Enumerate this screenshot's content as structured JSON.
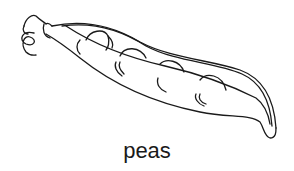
{
  "illustration": {
    "subject": "pea pod",
    "style": "black line art on white",
    "stroke_color": "#1a1a1a",
    "background": "#ffffff",
    "pea_count_visible": 4
  },
  "caption": {
    "text": "peas"
  }
}
